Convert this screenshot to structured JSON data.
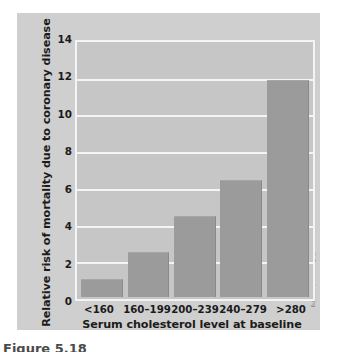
{
  "figure": {
    "credit": "© Cengage Learning",
    "caption": "Figure  5.18"
  },
  "chart_data": {
    "type": "bar",
    "title": "",
    "xlabel": "Serum cholesterol level at baseline",
    "ylabel": "Relative risk of mortality due to coronary disease",
    "categories": [
      "<160",
      "160–199",
      "200–239",
      "240–279",
      ">280"
    ],
    "values": [
      1.0,
      2.5,
      4.5,
      6.5,
      12.0
    ],
    "ylim": [
      0,
      14
    ],
    "yticks": [
      14,
      12,
      10,
      8,
      6,
      4,
      2,
      0
    ],
    "ytick_labels": [
      "14",
      "12",
      "10",
      "8",
      "6",
      "4",
      "2",
      "0"
    ],
    "grid": true,
    "legend": false,
    "bar_color": "#9b9b9b",
    "plot_background": "#c6c6c6",
    "grid_color": "#f4f4f4",
    "panel_background": "#cfcfcf"
  }
}
